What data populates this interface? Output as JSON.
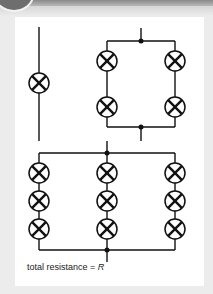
{
  "figure": {
    "caption_text": "total resistance = ",
    "caption_symbol": "R",
    "circuits": [
      {
        "name": "single-lamp",
        "branches": 1,
        "lamps_per_branch": 1
      },
      {
        "name": "two-parallel-branches-of-two",
        "branches": 2,
        "lamps_per_branch": 2
      },
      {
        "name": "three-parallel-branches-of-three",
        "branches": 3,
        "lamps_per_branch": 3
      }
    ],
    "colors": {
      "line": "#111111",
      "panel": "#ffffff",
      "background": "#ececec"
    }
  }
}
